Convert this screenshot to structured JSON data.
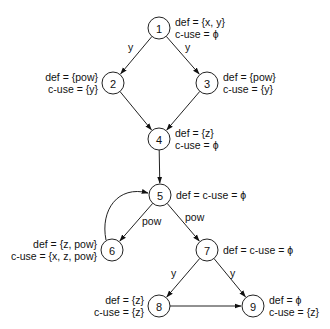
{
  "diagram": {
    "type": "control-flow-graph",
    "nodes": [
      {
        "id": "1",
        "x": 159,
        "y": 28,
        "def": "def = {x, y}",
        "cuse": "c-use = ϕ",
        "side": "right"
      },
      {
        "id": "2",
        "x": 113,
        "y": 83,
        "def": "def = {pow}",
        "cuse": "c-use = {y}",
        "side": "left"
      },
      {
        "id": "3",
        "x": 207,
        "y": 83,
        "def": "def = {pow}",
        "cuse": "c-use = {y}",
        "side": "right"
      },
      {
        "id": "4",
        "x": 159,
        "y": 139,
        "def": "def = {z}",
        "cuse": "c-use = ϕ",
        "side": "right"
      },
      {
        "id": "5",
        "x": 160,
        "y": 195,
        "def": "def = c-use = ϕ",
        "cuse": "",
        "side": "right"
      },
      {
        "id": "6",
        "x": 112,
        "y": 250,
        "def": "def = {z, pow}",
        "cuse": "c-use = {x, z, pow}",
        "side": "left"
      },
      {
        "id": "7",
        "x": 207,
        "y": 250,
        "def": "def = c-use = ϕ",
        "cuse": "",
        "side": "right"
      },
      {
        "id": "8",
        "x": 159,
        "y": 306,
        "def": "def = {z}",
        "cuse": "c-use = {z}",
        "side": "left"
      },
      {
        "id": "9",
        "x": 253,
        "y": 306,
        "def": "def = ϕ",
        "cuse": "c-use = {z}",
        "side": "right"
      }
    ],
    "edges": [
      {
        "from": "1",
        "to": "2",
        "label": "y",
        "lx": 128,
        "ly": 51
      },
      {
        "from": "1",
        "to": "3",
        "label": "y",
        "lx": 185,
        "ly": 51
      },
      {
        "from": "2",
        "to": "4",
        "label": ""
      },
      {
        "from": "3",
        "to": "4",
        "label": ""
      },
      {
        "from": "4",
        "to": "5",
        "label": ""
      },
      {
        "from": "5",
        "to": "6",
        "label": "pow",
        "lx": 142,
        "ly": 225
      },
      {
        "from": "5",
        "to": "7",
        "label": "pow",
        "lx": 185,
        "ly": 221
      },
      {
        "from": "6",
        "to": "5",
        "label": "",
        "curved": true
      },
      {
        "from": "7",
        "to": "8",
        "label": "y",
        "lx": 171,
        "ly": 277
      },
      {
        "from": "7",
        "to": "9",
        "label": "y",
        "lx": 230,
        "ly": 277
      },
      {
        "from": "8",
        "to": "9",
        "label": ""
      }
    ]
  }
}
